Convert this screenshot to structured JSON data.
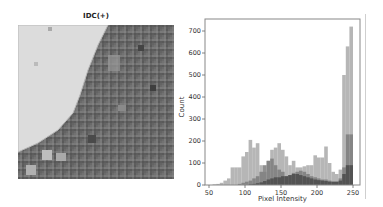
{
  "image_panel": {
    "title": "IDC(+)"
  },
  "chart_data": {
    "type": "bar",
    "title": "",
    "xlabel": "Pixel Intensity",
    "ylabel": "Count",
    "xlim": [
      45,
      255
    ],
    "ylim": [
      0,
      750
    ],
    "xticks": [
      50,
      100,
      150,
      200,
      250
    ],
    "yticks": [
      0,
      100,
      200,
      300,
      400,
      500,
      600,
      700
    ],
    "grid": false,
    "legend": null,
    "bin_width": 5,
    "bin_starts": [
      50,
      55,
      60,
      65,
      70,
      75,
      80,
      85,
      90,
      95,
      100,
      105,
      110,
      115,
      120,
      125,
      130,
      135,
      140,
      145,
      150,
      155,
      160,
      165,
      170,
      175,
      180,
      185,
      190,
      195,
      200,
      205,
      210,
      215,
      220,
      225,
      230,
      235,
      240,
      245
    ],
    "series": [
      {
        "name": "channel_light",
        "color": "#a9a9a9",
        "values": [
          0,
          3,
          5,
          10,
          20,
          30,
          80,
          80,
          80,
          130,
          150,
          205,
          170,
          190,
          90,
          60,
          110,
          160,
          170,
          190,
          160,
          130,
          90,
          110,
          80,
          80,
          85,
          90,
          90,
          135,
          125,
          125,
          175,
          100,
          60,
          50,
          70,
          500,
          630,
          720
        ]
      },
      {
        "name": "channel_mid",
        "color": "#7d7d7d",
        "values": [
          0,
          0,
          0,
          0,
          0,
          0,
          0,
          0,
          5,
          10,
          15,
          20,
          30,
          40,
          60,
          90,
          110,
          120,
          90,
          70,
          60,
          40,
          45,
          55,
          60,
          65,
          60,
          50,
          40,
          35,
          30,
          25,
          25,
          20,
          15,
          15,
          30,
          80,
          230,
          230
        ]
      },
      {
        "name": "channel_dark",
        "color": "#4a4a4a",
        "values": [
          0,
          0,
          0,
          0,
          0,
          0,
          0,
          0,
          0,
          0,
          0,
          3,
          5,
          8,
          12,
          18,
          25,
          30,
          35,
          35,
          40,
          40,
          45,
          50,
          50,
          45,
          40,
          35,
          30,
          25,
          22,
          20,
          18,
          15,
          15,
          15,
          20,
          50,
          90,
          90
        ]
      }
    ]
  }
}
